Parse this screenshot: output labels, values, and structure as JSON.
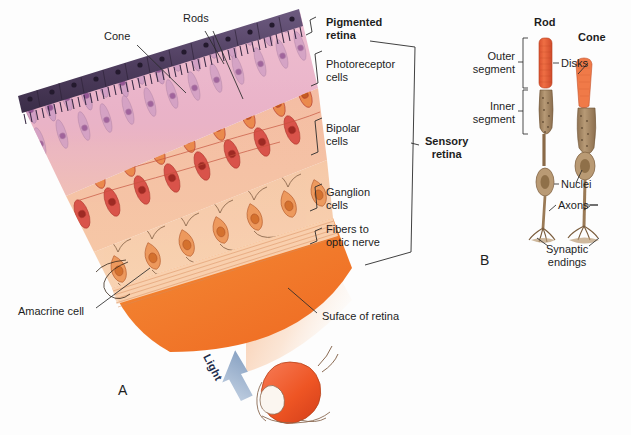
{
  "figure": {
    "panels": [
      {
        "id": "A",
        "x": 118,
        "y": 382
      },
      {
        "id": "B",
        "x": 480,
        "y": 259
      }
    ]
  },
  "panel_a": {
    "title_labels": [
      {
        "name": "cone",
        "text": "Cone",
        "x": 104,
        "y": 36,
        "align": "left"
      },
      {
        "name": "rods",
        "text": "Rods",
        "x": 183,
        "y": 18,
        "align": "left"
      }
    ],
    "layer_labels": [
      {
        "name": "pigmented-retina",
        "text": "Pigmented\nretina",
        "x": 326,
        "y": 22,
        "bold": true
      },
      {
        "name": "photoreceptor-cells",
        "text": "Photoreceptor\ncells",
        "x": 326,
        "y": 64,
        "bold": false
      },
      {
        "name": "bipolar-cells",
        "text": "Bipolar\ncells",
        "x": 326,
        "y": 128,
        "bold": false
      },
      {
        "name": "ganglion-cells",
        "text": "Ganglion\ncells",
        "x": 326,
        "y": 192,
        "bold": false
      },
      {
        "name": "fibers-to-optic-nerve",
        "text": "Fibers to\noptic nerve",
        "x": 326,
        "y": 229,
        "bold": false
      }
    ],
    "sensory_retina": {
      "name": "sensory-retina",
      "text": "Sensory\nretina",
      "x": 425,
      "y": 141
    },
    "callouts": [
      {
        "name": "amacrine-cell",
        "text": "Amacrine cell",
        "x": 18,
        "y": 310
      },
      {
        "name": "surface-of-retina",
        "text": "Suface of retina",
        "x": 320,
        "y": 315
      }
    ],
    "light_arrow": {
      "name": "light-arrow",
      "text": "Light",
      "x": 212,
      "y": 352
    }
  },
  "panel_b": {
    "headers": [
      {
        "name": "rod-header",
        "text": "Rod",
        "x": 534,
        "y": 20
      },
      {
        "name": "cone-header",
        "text": "Cone",
        "x": 580,
        "y": 34
      }
    ],
    "bracket_labels": [
      {
        "name": "outer-segment",
        "text": "Outer\nsegment",
        "x": 469,
        "y": 52
      },
      {
        "name": "inner-segment",
        "text": "Inner\nsegment",
        "x": 469,
        "y": 104
      }
    ],
    "part_labels": [
      {
        "name": "disks",
        "text": "Disks",
        "x": 561,
        "y": 59
      },
      {
        "name": "nuclei",
        "text": "Nuclei",
        "x": 561,
        "y": 180
      },
      {
        "name": "axons",
        "text": "Axons",
        "x": 558,
        "y": 201
      },
      {
        "name": "synaptic-endings",
        "text": "Synaptic\nendings",
        "x": 546,
        "y": 247
      }
    ]
  },
  "colors": {
    "background": "#fdfdfd",
    "pigment_epithelium_dark": "#4a3a55",
    "pigment_epithelium_light": "#8a7a9c",
    "photoreceptor_layer": "#e8b8cc",
    "photoreceptor_cell": "#c490b8",
    "bipolar_layer": "#f3b9a2",
    "bipolar_cell": "#d9544a",
    "ganglion_layer": "#f5c3a4",
    "ganglion_cell": "#e88a52",
    "retina_surface": "#f2712c",
    "nerve_fiber": "#f7cba8",
    "rod_outer_segment": "#e8603c",
    "cone_outer_segment": "#ef7544",
    "inner_segment": "#a98a68",
    "leader_line": "#2b2b2b",
    "light_arrow": "#9fb4cf",
    "eye_globe": "#ee5a2a",
    "text": "#1d1d1d"
  }
}
